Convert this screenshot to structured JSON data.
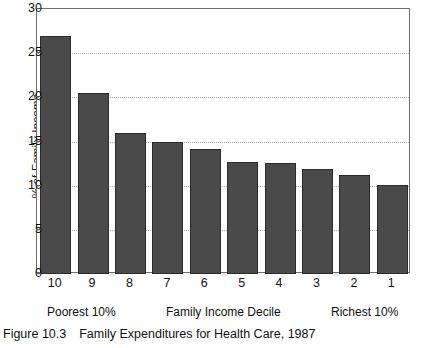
{
  "figure": {
    "caption_label": "Figure 10.3",
    "caption_text": "Family Expenditures for Health Care, 1987"
  },
  "annotations": {
    "left": "Poorest 10%",
    "center": "Family Income Decile",
    "right": "Richest 10%"
  },
  "chart_data": {
    "type": "bar",
    "title": "Family Expenditures for Health Care, 1987",
    "xlabel": "Family Income Decile",
    "ylabel": "% of Family Income",
    "categories": [
      "10",
      "9",
      "8",
      "7",
      "6",
      "5",
      "4",
      "3",
      "2",
      "1"
    ],
    "values": [
      27.0,
      20.5,
      16.0,
      14.9,
      14.2,
      12.7,
      12.6,
      11.9,
      11.2,
      10.1
    ],
    "ylim": [
      0,
      30
    ],
    "yticks": [
      0,
      5,
      10,
      15,
      20,
      25,
      30
    ],
    "gridlines": [
      5,
      10,
      15,
      20,
      25
    ],
    "grid": true,
    "legend": "none",
    "bar_color": "#4a4a4a",
    "bar_edge_color": "#2b2b2b",
    "axis_color": "#6f6f6f",
    "grid_color": "#b6b6b6",
    "annotations": [
      "Poorest 10%",
      "Family Income Decile",
      "Richest 10%"
    ]
  }
}
